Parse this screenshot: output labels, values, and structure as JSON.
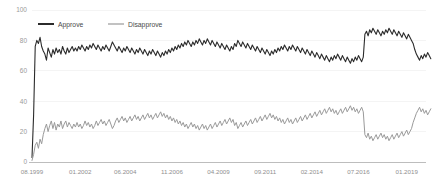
{
  "chart_data": {
    "type": "line",
    "title": "",
    "subtitle": "",
    "xlabel": "",
    "ylabel": "",
    "ylim": [
      0,
      100
    ],
    "yticks": [
      0,
      20,
      40,
      60,
      80,
      100
    ],
    "ytick_labels": [
      "0",
      "20",
      "40",
      "60",
      "80",
      "100"
    ],
    "grid": true,
    "grid_axis": "y",
    "legend_position": "top-left",
    "xticks": [
      0,
      30,
      58,
      87,
      116,
      145,
      174,
      203,
      233
    ],
    "xtick_labels": [
      "08.1999",
      "01.2002",
      "06.2004",
      "11.2006",
      "04.2009",
      "09.2011",
      "02.2014",
      "07.2016",
      "01.2019"
    ],
    "x_index_range": [
      0,
      245
    ],
    "series": [
      {
        "name": "Approve",
        "color": "#2b2b2b",
        "stroke_width": 1.1,
        "values": [
          3,
          31,
          76,
          80,
          78,
          82,
          76,
          73,
          71,
          67,
          75,
          72,
          69,
          74,
          71,
          75,
          72,
          74,
          71,
          76,
          73,
          71,
          75,
          72,
          74,
          76,
          73,
          75,
          73,
          76,
          74,
          77,
          75,
          73,
          76,
          74,
          77,
          75,
          78,
          76,
          74,
          77,
          75,
          73,
          76,
          74,
          77,
          75,
          73,
          76,
          79,
          77,
          75,
          73,
          76,
          74,
          72,
          75,
          73,
          76,
          74,
          72,
          75,
          73,
          71,
          74,
          72,
          75,
          73,
          71,
          74,
          72,
          70,
          73,
          71,
          74,
          72,
          70,
          73,
          71,
          69,
          72,
          70,
          73,
          71,
          74,
          72,
          75,
          73,
          76,
          74,
          77,
          75,
          78,
          76,
          79,
          77,
          80,
          78,
          76,
          79,
          77,
          80,
          78,
          81,
          79,
          77,
          80,
          78,
          81,
          79,
          77,
          80,
          78,
          76,
          79,
          77,
          75,
          78,
          76,
          74,
          77,
          75,
          73,
          76,
          74,
          78,
          76,
          80,
          78,
          76,
          79,
          77,
          75,
          78,
          76,
          74,
          77,
          75,
          73,
          76,
          74,
          72,
          75,
          73,
          71,
          74,
          72,
          70,
          73,
          71,
          74,
          72,
          75,
          73,
          76,
          74,
          77,
          75,
          73,
          76,
          74,
          77,
          75,
          73,
          76,
          74,
          72,
          75,
          73,
          71,
          74,
          72,
          70,
          73,
          71,
          69,
          72,
          70,
          68,
          71,
          69,
          67,
          70,
          68,
          66,
          69,
          67,
          70,
          68,
          71,
          69,
          67,
          70,
          68,
          66,
          69,
          67,
          65,
          68,
          66,
          69,
          67,
          70,
          68,
          66,
          69,
          84,
          86,
          83,
          87,
          85,
          88,
          86,
          84,
          87,
          85,
          83,
          86,
          84,
          87,
          85,
          88,
          86,
          84,
          87,
          85,
          83,
          86,
          84,
          82,
          85,
          83,
          81,
          84,
          82,
          80,
          78,
          74,
          71,
          69,
          67,
          70,
          68,
          71,
          69,
          72,
          70,
          68
        ]
      },
      {
        "name": "Disapprove",
        "color": "#9a9a9a",
        "stroke_width": 1.0,
        "values": [
          1,
          5,
          11,
          13,
          9,
          15,
          12,
          18,
          22,
          25,
          20,
          24,
          27,
          22,
          26,
          21,
          25,
          23,
          27,
          22,
          25,
          27,
          23,
          26,
          24,
          22,
          25,
          23,
          26,
          23,
          25,
          22,
          24,
          27,
          24,
          26,
          23,
          25,
          22,
          24,
          27,
          24,
          26,
          28,
          25,
          27,
          24,
          26,
          28,
          25,
          22,
          24,
          27,
          29,
          26,
          28,
          30,
          27,
          29,
          26,
          28,
          30,
          27,
          29,
          31,
          28,
          30,
          27,
          29,
          31,
          28,
          30,
          32,
          29,
          31,
          28,
          30,
          32,
          29,
          31,
          33,
          30,
          32,
          29,
          31,
          28,
          30,
          27,
          29,
          26,
          28,
          25,
          27,
          24,
          26,
          23,
          25,
          22,
          24,
          26,
          23,
          25,
          22,
          24,
          21,
          23,
          25,
          22,
          24,
          21,
          23,
          25,
          22,
          24,
          26,
          23,
          25,
          27,
          24,
          26,
          28,
          25,
          27,
          29,
          26,
          28,
          24,
          26,
          22,
          24,
          26,
          23,
          25,
          27,
          24,
          26,
          28,
          25,
          27,
          29,
          26,
          28,
          30,
          27,
          29,
          31,
          28,
          30,
          32,
          29,
          31,
          28,
          30,
          27,
          29,
          26,
          28,
          25,
          27,
          29,
          26,
          28,
          25,
          27,
          29,
          26,
          28,
          30,
          27,
          29,
          31,
          28,
          30,
          32,
          29,
          31,
          33,
          30,
          32,
          34,
          31,
          33,
          35,
          32,
          34,
          36,
          33,
          35,
          32,
          34,
          31,
          33,
          35,
          32,
          34,
          36,
          33,
          35,
          37,
          34,
          36,
          33,
          35,
          32,
          34,
          36,
          33,
          18,
          16,
          19,
          15,
          17,
          14,
          16,
          18,
          15,
          17,
          19,
          16,
          18,
          15,
          17,
          14,
          16,
          18,
          15,
          17,
          19,
          16,
          18,
          20,
          17,
          19,
          21,
          18,
          20,
          22,
          26,
          29,
          32,
          34,
          36,
          33,
          35,
          32,
          34,
          31,
          33,
          35
        ]
      }
    ]
  }
}
